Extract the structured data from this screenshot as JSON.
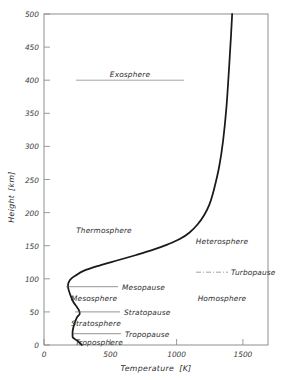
{
  "chart_data": {
    "type": "line",
    "title": "",
    "xlabel": "Temperature",
    "xunit": "[K]",
    "ylabel": "Height",
    "yunit": "[km]",
    "xlim": [
      0,
      1700
    ],
    "ylim": [
      0,
      500
    ],
    "xticks": [
      0,
      500,
      1000,
      1500
    ],
    "yticks": [
      0,
      50,
      100,
      150,
      200,
      250,
      300,
      350,
      400,
      450,
      500
    ],
    "grid": false,
    "legend": "none",
    "series": [
      {
        "name": "Standard atmosphere temperature profile",
        "x": [
          288,
          255,
          220,
          217,
          217,
          221,
          231,
          251,
          271,
          266,
          247,
          223,
          201,
          186,
          182,
          188,
          205,
          240,
          300,
          420,
          560,
          700,
          830,
          940,
          1030,
          1105,
          1165,
          1215,
          1255,
          1290,
          1330,
          1360,
          1385,
          1405,
          1420,
          1428
        ],
        "y": [
          0,
          6,
          11,
          14,
          20,
          25,
          32,
          42,
          47,
          52,
          58,
          65,
          75,
          84,
          90,
          95,
          100,
          105,
          112,
          120,
          128,
          136,
          144,
          152,
          160,
          170,
          182,
          196,
          212,
          235,
          270,
          310,
          360,
          420,
          470,
          500
        ]
      }
    ],
    "annotations": [
      {
        "label": "Exosphere",
        "height_km": 400,
        "temp_k": 470,
        "type": "region-left",
        "rule": true
      },
      {
        "label": "Thermosphere",
        "height_km": 185,
        "temp_k": 260,
        "type": "region-left",
        "rule": false
      },
      {
        "label": "Mesopause",
        "height_km": 88,
        "temp_k": 700,
        "type": "leader"
      },
      {
        "label": "Mesosphere",
        "height_km": 70,
        "temp_k": 440,
        "type": "region-left",
        "rule": false
      },
      {
        "label": "Stratopause",
        "height_km": 50,
        "temp_k": 700,
        "type": "leader"
      },
      {
        "label": "Stratosphere",
        "height_km": 34,
        "temp_k": 440,
        "type": "region-left",
        "rule": false
      },
      {
        "label": "Tropopause",
        "height_km": 17,
        "temp_k": 700,
        "type": "leader"
      },
      {
        "label": "Troposphere",
        "height_km": 7,
        "temp_k": 440,
        "type": "region-left",
        "rule": false
      },
      {
        "label": "Heterosphere",
        "height_km": 158,
        "temp_k": 1230,
        "type": "region-right"
      },
      {
        "label": "Turbopause",
        "height_km": 110,
        "temp_k": 1380,
        "type": "region-right",
        "rule": true
      },
      {
        "label": "Homosphere",
        "height_km": 72,
        "temp_k": 1230,
        "type": "region-right"
      }
    ]
  },
  "axes": {
    "y_tick_labels": [
      "0",
      "50",
      "100",
      "150",
      "200",
      "250",
      "300",
      "350",
      "400",
      "450",
      "500"
    ],
    "x_tick_labels": [
      "0",
      "500",
      "1000",
      "1500"
    ],
    "x_axis_title": "Temperature",
    "x_axis_unit": "[K]",
    "y_axis_title": "Height",
    "y_axis_unit": "[km]"
  },
  "labels": {
    "exosphere": "Exosphere",
    "thermosphere": "Thermosphere",
    "mesopause": "Mesopause",
    "mesosphere": "Mesosphere",
    "stratopause": "Stratopause",
    "stratosphere": "Stratosphere",
    "tropopause": "Tropopause",
    "troposphere": "Troposphere",
    "heterosphere": "Heterosphere",
    "turbopause": "Turbopause",
    "homosphere": "Homosphere"
  },
  "colors": {
    "curve": "#1a1a1a",
    "frame": "#8e8e8e",
    "text": "#2e2e2e",
    "leader": "#666666",
    "background": "#ffffff"
  }
}
